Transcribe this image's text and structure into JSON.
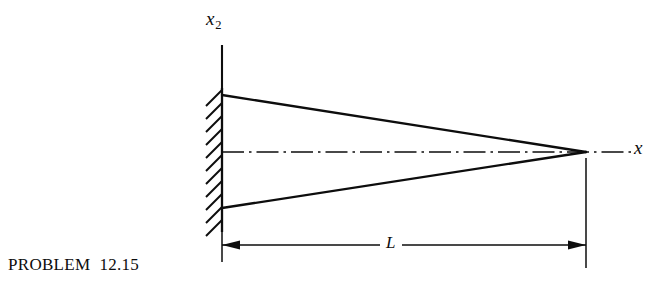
{
  "figure": {
    "caption": {
      "problem_word": "PROBLEM",
      "problem_number": "12.15",
      "full": "PROBLEM 12.15"
    },
    "axes": {
      "vertical": {
        "name": "x2",
        "letter": "x",
        "subscript": "2"
      },
      "horizontal": {
        "name": "x1",
        "letter": "x",
        "subscript": ""
      }
    },
    "dimension": {
      "label": "L",
      "description": "overall length from fixed wall to tip"
    },
    "support": {
      "type": "fixed-wall-hatching",
      "hatch_count": 11
    },
    "body": {
      "type": "tapered-cantilever-wedge",
      "description": "triangular tapered beam fixed at left wall, converging to a point at right"
    },
    "colors": {
      "ink": "#0d0d0d",
      "background": "#ffffff"
    }
  }
}
